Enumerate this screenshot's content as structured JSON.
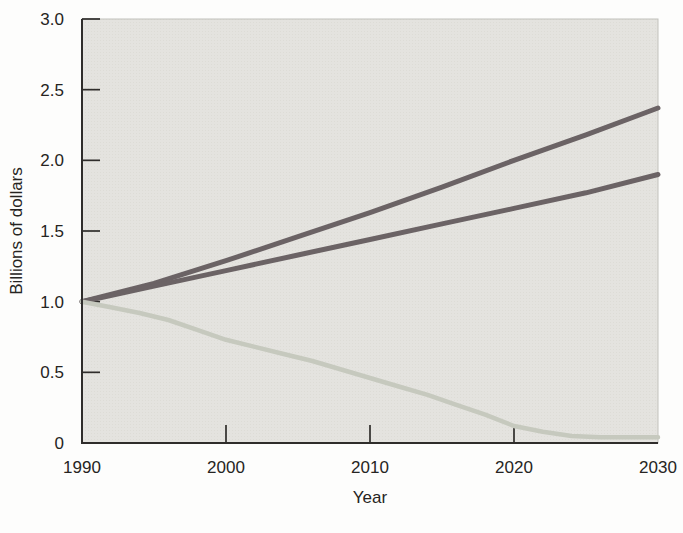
{
  "chart_data": {
    "type": "line",
    "title": "",
    "xlabel": "Year",
    "ylabel": "Billions of dollars",
    "xlim": [
      1990,
      2030
    ],
    "ylim": [
      0,
      3.0
    ],
    "x_tick_values": [
      1990,
      2000,
      2010,
      2020,
      2030
    ],
    "x_tick_labels": [
      "1990",
      "2000",
      "2010",
      "2020",
      "2030"
    ],
    "y_tick_values": [
      3.0,
      2.5,
      2.0,
      1.5,
      1.0,
      0.5,
      0
    ],
    "y_tick_labels": [
      "3.0",
      "2.5",
      "2.0",
      "1.5",
      "1.0",
      "0.5",
      "0"
    ],
    "grid": false,
    "legend": "none",
    "plot_background_color": "#e4e3df",
    "plot_texture_color": "#dddcd6",
    "axis_color": "#2f2d2b",
    "frame_color": "#c2c1bb",
    "series": [
      {
        "name": "dark-upper-rising-line",
        "color": "#6b6365",
        "width": 5,
        "points": [
          [
            1990,
            1.0
          ],
          [
            1995,
            1.13
          ],
          [
            2000,
            1.29
          ],
          [
            2005,
            1.46
          ],
          [
            2010,
            1.63
          ],
          [
            2015,
            1.81
          ],
          [
            2020,
            2.0
          ],
          [
            2025,
            2.18
          ],
          [
            2030,
            2.37
          ]
        ]
      },
      {
        "name": "dark-lower-rising-line",
        "color": "#6b6365",
        "width": 5,
        "points": [
          [
            1990,
            1.0
          ],
          [
            1995,
            1.11
          ],
          [
            2000,
            1.22
          ],
          [
            2005,
            1.33
          ],
          [
            2010,
            1.44
          ],
          [
            2015,
            1.55
          ],
          [
            2020,
            1.66
          ],
          [
            2025,
            1.77
          ],
          [
            2030,
            1.9
          ]
        ]
      },
      {
        "name": "light-declining-line",
        "color": "#c6c9be",
        "width": 4.5,
        "points": [
          [
            1990,
            1.0
          ],
          [
            1992,
            0.96
          ],
          [
            1994,
            0.92
          ],
          [
            1996,
            0.87
          ],
          [
            1998,
            0.8
          ],
          [
            2000,
            0.73
          ],
          [
            2002,
            0.68
          ],
          [
            2004,
            0.63
          ],
          [
            2006,
            0.58
          ],
          [
            2008,
            0.52
          ],
          [
            2010,
            0.46
          ],
          [
            2012,
            0.4
          ],
          [
            2014,
            0.34
          ],
          [
            2016,
            0.27
          ],
          [
            2018,
            0.2
          ],
          [
            2020,
            0.12
          ],
          [
            2022,
            0.08
          ],
          [
            2024,
            0.05
          ],
          [
            2026,
            0.04
          ],
          [
            2028,
            0.04
          ],
          [
            2030,
            0.04
          ]
        ]
      }
    ]
  }
}
